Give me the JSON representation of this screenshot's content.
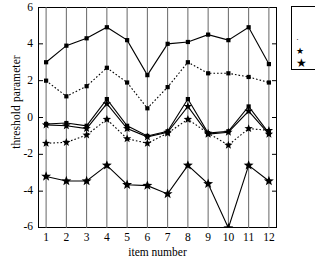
{
  "chart_data": {
    "type": "line",
    "title": "",
    "xlabel": "item number",
    "ylabel": "threshold parameter",
    "categories": [
      1,
      2,
      3,
      4,
      5,
      6,
      7,
      8,
      9,
      10,
      11,
      12
    ],
    "x": [
      1,
      2,
      3,
      4,
      5,
      6,
      7,
      8,
      9,
      10,
      11,
      12
    ],
    "xlim": [
      0.6,
      12.4
    ],
    "ylim": [
      -6,
      6
    ],
    "yticks": [
      -6,
      -4,
      -2,
      0,
      2,
      4,
      6
    ],
    "xticks": [
      1,
      2,
      3,
      4,
      5,
      6,
      7,
      8,
      9,
      10,
      11,
      12
    ],
    "grid": "vertical",
    "legend_position": "top-right-outside-clipped",
    "series": [
      {
        "name": "series-1-top-solid-square",
        "style": "solid",
        "marker": "square",
        "values": [
          3.0,
          3.9,
          4.3,
          4.9,
          4.2,
          2.3,
          4.0,
          4.1,
          4.5,
          4.2,
          4.9,
          2.9
        ]
      },
      {
        "name": "series-2-dotted-square",
        "style": "dotted",
        "marker": "square",
        "values": [
          2.0,
          1.15,
          1.7,
          2.7,
          1.9,
          0.5,
          1.65,
          3.0,
          2.4,
          2.4,
          2.2,
          1.9
        ]
      },
      {
        "name": "series-3-mid-solid-square",
        "style": "solid",
        "marker": "square",
        "values": [
          -0.35,
          -0.3,
          -0.45,
          1.0,
          -0.45,
          -1.0,
          -0.75,
          1.0,
          -0.85,
          -0.75,
          0.6,
          -0.85
        ]
      },
      {
        "name": "series-4-mid-star",
        "style": "solid",
        "marker": "star",
        "values": [
          -0.4,
          -0.45,
          -0.6,
          0.75,
          -0.6,
          -1.05,
          -0.8,
          0.6,
          -0.9,
          -0.8,
          0.35,
          -0.9
        ]
      },
      {
        "name": "series-5-dotted-star",
        "style": "dotted",
        "marker": "star",
        "values": [
          -1.4,
          -1.35,
          -0.95,
          -0.1,
          -1.15,
          -1.4,
          -0.85,
          -0.1,
          -0.85,
          -1.5,
          -0.6,
          -0.7
        ]
      },
      {
        "name": "series-6-bottom-star",
        "style": "solid",
        "marker": "star",
        "values": [
          -3.2,
          -3.45,
          -3.45,
          -2.6,
          -3.65,
          -3.7,
          -4.15,
          -2.6,
          -3.6,
          -6.0,
          -2.6,
          -3.45
        ]
      }
    ],
    "legend_entries": [
      {
        "marker": "dot"
      },
      {
        "marker": "small-star"
      },
      {
        "marker": "large-star"
      }
    ]
  }
}
